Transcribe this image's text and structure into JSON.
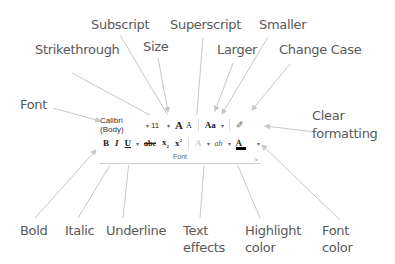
{
  "callouts": {
    "subscript": "Subscript",
    "superscript": "Superscript",
    "smaller": "Smaller",
    "strikethrough": "Strikethrough",
    "size": "Size",
    "larger": "Larger",
    "change_case": "Change Case",
    "font": "Font",
    "clear_formatting_1": "Clear",
    "clear_formatting_2": "formatting",
    "bold": "Bold",
    "italic": "Italic",
    "underline": "Underline",
    "text_effects_1": "Text",
    "text_effects_2": "effects",
    "highlight_color_1": "Highlight",
    "highlight_color_2": "color",
    "font_color_1": "Font",
    "font_color_2": "color"
  },
  "font_group": {
    "font_name": "Calibri (Body)",
    "font_size": "11",
    "grow_glyph": "A",
    "shrink_glyph": "A",
    "change_case_glyph": "Aa",
    "clear_glyph": "✐",
    "bold_glyph": "B",
    "italic_glyph": "I",
    "underline_glyph": "U",
    "strike_glyph": "abc",
    "subscript_glyph": "x",
    "superscript_glyph": "x",
    "text_effects_glyph": "A",
    "highlight_glyph": "ab",
    "font_color_glyph": "A",
    "dropdown_glyph": "▾",
    "group_label": "Font",
    "launcher_glyph": "↘"
  },
  "colors": {
    "label_text": "#595959",
    "arrow": "#c8c8c8",
    "font_color_bar": "#000000"
  }
}
